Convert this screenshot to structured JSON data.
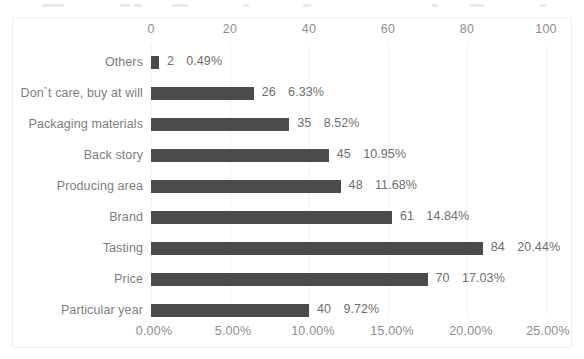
{
  "chart_data": {
    "type": "bar",
    "orientation": "horizontal",
    "title": "",
    "xlabel": "",
    "ylabel": "",
    "grid": true,
    "legend": "none",
    "categories": [
      "Others",
      "Don`t care, buy at will",
      "Packaging materials",
      "Back story",
      "Producing area",
      "Brand",
      "Tasting",
      "Price",
      "Particular year"
    ],
    "values": [
      2,
      26,
      35,
      45,
      48,
      61,
      84,
      70,
      40
    ],
    "percent_labels": [
      "0.49%",
      "6.33%",
      "8.52%",
      "10.95%",
      "11.68%",
      "14.84%",
      "20.44%",
      "17.03%",
      "9.72%"
    ],
    "value_labels": [
      "2",
      "26",
      "35",
      "45",
      "48",
      "61",
      "84",
      "70",
      "40"
    ],
    "top_axis": {
      "name": "count",
      "ticks": [
        0,
        20,
        40,
        60,
        80,
        100
      ],
      "tick_labels": [
        "0",
        "20",
        "40",
        "60",
        "80",
        "100"
      ],
      "lim": [
        0,
        100
      ]
    },
    "bottom_axis": {
      "name": "percent",
      "ticks": [
        0,
        5,
        10,
        15,
        20,
        25
      ],
      "tick_labels": [
        "0.00%",
        "5.00%",
        "10.00%",
        "15.00%",
        "20.00%",
        "25.00%"
      ],
      "lim": [
        0,
        25
      ]
    },
    "series_color": "#4b4b4b",
    "gridline_color": "#f2f2f2",
    "text_color": "#7d7d7d"
  }
}
